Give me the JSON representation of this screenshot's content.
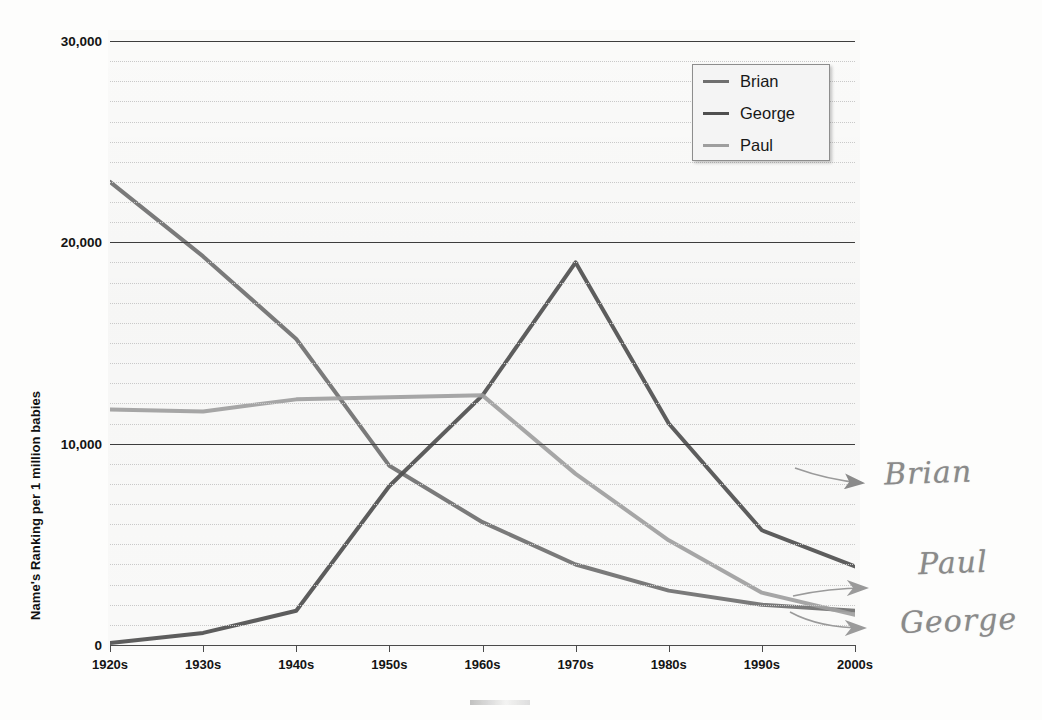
{
  "chart_data": {
    "type": "line",
    "title": "",
    "subtitle": "",
    "xlabel": "",
    "ylabel": "Name's Ranking per 1 million babies",
    "categories": [
      "1920s",
      "1930s",
      "1940s",
      "1950s",
      "1960s",
      "1970s",
      "1980s",
      "1990s",
      "2000s"
    ],
    "ylim": [
      0,
      30000
    ],
    "xlim_categories": 9,
    "ytick_labels": [
      "0",
      "10,000",
      "20,000",
      "30,000"
    ],
    "ytick_values": [
      0,
      10000,
      20000,
      30000
    ],
    "grid": {
      "major_interval": 10000,
      "minor_interval": 1000,
      "major_style": "solid",
      "minor_style": "dotted",
      "horizontal_only": true
    },
    "legend": {
      "position": "top-right",
      "entries": [
        "Brian",
        "George",
        "Paul"
      ]
    },
    "series": [
      {
        "name": "Brian",
        "color": "#6f6f6f",
        "values": [
          23000,
          19300,
          15200,
          8900,
          6100,
          4000,
          2700,
          2000,
          1700
        ]
      },
      {
        "name": "George",
        "color": "#4f4f4f",
        "values": [
          100,
          600,
          1700,
          7900,
          12400,
          19000,
          11000,
          5700,
          3900
        ]
      },
      {
        "name": "Paul",
        "color": "#9e9e9e",
        "values": [
          11700,
          11600,
          12200,
          12300,
          12400,
          8500,
          5200,
          2600,
          1500
        ]
      }
    ],
    "annotations": [
      {
        "text": "Brian",
        "kind": "handwritten-label",
        "arrow": "left",
        "points_to_series": "George"
      },
      {
        "text": "Paul",
        "kind": "handwritten-label",
        "arrow": "left",
        "points_to_series": "Brian"
      },
      {
        "text": "George",
        "kind": "handwritten-label",
        "arrow": "left",
        "points_to_series": "Paul"
      }
    ]
  },
  "legend": {
    "entries": [
      {
        "label": "Brian",
        "color": "#6f6f6f"
      },
      {
        "label": "George",
        "color": "#4f4f4f"
      },
      {
        "label": "Paul",
        "color": "#9e9e9e"
      }
    ]
  },
  "axes": {
    "y_title": "Name's Ranking per 1 million babies",
    "y_ticks": [
      "30,000",
      "20,000",
      "10,000",
      "0"
    ],
    "x_ticks": [
      "1920s",
      "1930s",
      "1940s",
      "1950s",
      "1960s",
      "1970s",
      "1980s",
      "1990s",
      "2000s"
    ]
  },
  "handwriting": {
    "brian": "Brian",
    "paul": "Paul",
    "george": "George"
  }
}
